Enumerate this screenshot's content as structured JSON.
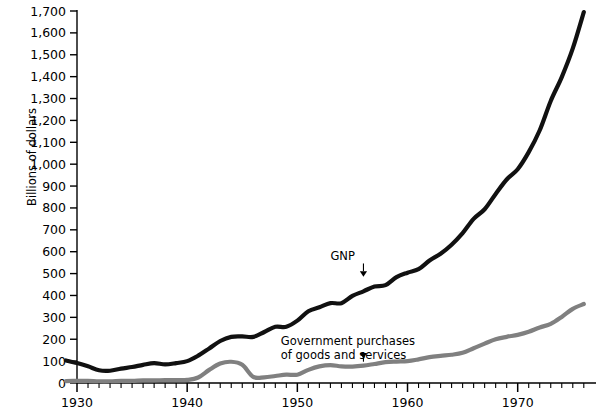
{
  "chart_data": {
    "type": "line",
    "title": "",
    "xlabel": "",
    "ylabel": "Billions of dollars",
    "xlim": [
      1929,
      1976
    ],
    "ylim": [
      0,
      1700
    ],
    "grid": false,
    "legend_position": "inline-annotations",
    "y_ticks": [
      0,
      100,
      200,
      300,
      400,
      500,
      600,
      700,
      800,
      900,
      1000,
      1100,
      1200,
      1300,
      1400,
      1500,
      1600,
      1700
    ],
    "y_tick_labels": [
      "0",
      "100",
      "200",
      "300",
      "400",
      "500",
      "600",
      "700",
      "800",
      "900",
      "1,000",
      "1,100",
      "1,200",
      "1,300",
      "1,400",
      "1,500",
      "1,600",
      "1,700"
    ],
    "x_ticks": [
      1930,
      1931,
      1932,
      1933,
      1934,
      1935,
      1936,
      1937,
      1938,
      1939,
      1940,
      1941,
      1942,
      1943,
      1944,
      1945,
      1946,
      1947,
      1948,
      1949,
      1950,
      1951,
      1952,
      1953,
      1954,
      1955,
      1956,
      1957,
      1958,
      1959,
      1960,
      1961,
      1962,
      1963,
      1964,
      1965,
      1966,
      1967,
      1968,
      1969,
      1970,
      1971,
      1972,
      1973,
      1974,
      1975,
      1976
    ],
    "x_major_ticks": [
      1930,
      1940,
      1950,
      1960,
      1970
    ],
    "x_tick_labels": [
      "1930",
      "1940",
      "1950",
      "1960",
      "1970"
    ],
    "series": [
      {
        "name": "GNP",
        "color": "#111111",
        "width": 4.2,
        "annotation": {
          "label": "GNP",
          "x": 1956,
          "y": 470,
          "text_x": 1953.0,
          "text_y": 560
        },
        "x": [
          1929,
          1930,
          1931,
          1932,
          1933,
          1934,
          1935,
          1936,
          1937,
          1938,
          1939,
          1940,
          1941,
          1942,
          1943,
          1944,
          1945,
          1946,
          1947,
          1948,
          1949,
          1950,
          1951,
          1952,
          1953,
          1954,
          1955,
          1956,
          1957,
          1958,
          1959,
          1960,
          1961,
          1962,
          1963,
          1964,
          1965,
          1966,
          1967,
          1968,
          1969,
          1970,
          1971,
          1972,
          1973,
          1974,
          1975,
          1976
        ],
        "y": [
          103,
          91,
          76,
          58,
          56,
          66,
          73,
          83,
          91,
          85,
          91,
          100,
          125,
          158,
          192,
          211,
          213,
          211,
          233,
          257,
          257,
          285,
          328,
          346,
          365,
          365,
          398,
          419,
          441,
          447,
          484,
          504,
          520,
          560,
          591,
          632,
          685,
          750,
          794,
          864,
          930,
          977,
          1055,
          1155,
          1289,
          1398,
          1529,
          1695
        ]
      },
      {
        "name": "Government purchases of goods and services",
        "color": "#808080",
        "width": 4.2,
        "annotation": {
          "label": "Government purchases\nof goods and services",
          "x": 1956,
          "y": 96,
          "text_x": 1948.5,
          "text_y": 175
        },
        "x": [
          1929,
          1930,
          1931,
          1932,
          1933,
          1934,
          1935,
          1936,
          1937,
          1938,
          1939,
          1940,
          1941,
          1942,
          1943,
          1944,
          1945,
          1946,
          1947,
          1948,
          1949,
          1950,
          1951,
          1952,
          1953,
          1954,
          1955,
          1956,
          1957,
          1958,
          1959,
          1960,
          1961,
          1962,
          1963,
          1964,
          1965,
          1966,
          1967,
          1968,
          1969,
          1970,
          1971,
          1972,
          1973,
          1974,
          1975,
          1976
        ],
        "y": [
          9,
          10,
          10,
          8,
          8,
          10,
          10,
          12,
          12,
          13,
          13,
          14,
          25,
          60,
          89,
          97,
          83,
          28,
          26,
          32,
          38,
          38,
          60,
          76,
          82,
          76,
          75,
          79,
          87,
          95,
          98,
          100,
          108,
          118,
          124,
          129,
          138,
          159,
          180,
          200,
          211,
          220,
          234,
          254,
          270,
          302,
          339,
          361
        ]
      }
    ]
  },
  "axis": {
    "y_axis_title": "Billions of dollars"
  },
  "annotations": {
    "gnp_label": "GNP",
    "gov_label_line1": "Government purchases",
    "gov_label_line2": "of goods and services"
  },
  "colors": {
    "gnp": "#111111",
    "government": "#808080",
    "axis": "#000000",
    "background": "#ffffff"
  }
}
